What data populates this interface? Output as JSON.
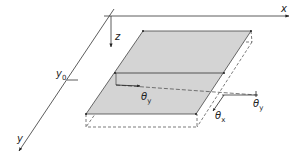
{
  "diagram": {
    "type": "3D plate with coordinate axes and rotations",
    "axes": {
      "x": {
        "label": "x"
      },
      "y": {
        "label": "y",
        "tick_label": "y",
        "tick_sub": "0"
      },
      "z": {
        "label": "z"
      }
    },
    "rotations": {
      "theta_y_left": {
        "symbol": "θ",
        "sub": "y"
      },
      "theta_y_right": {
        "symbol": "θ",
        "sub": "y"
      },
      "theta_x": {
        "symbol": "θ",
        "sub": "x"
      }
    },
    "colors": {
      "plate_fill": "#d4d4d4",
      "line": "#333333",
      "dashed": "#444444"
    }
  }
}
